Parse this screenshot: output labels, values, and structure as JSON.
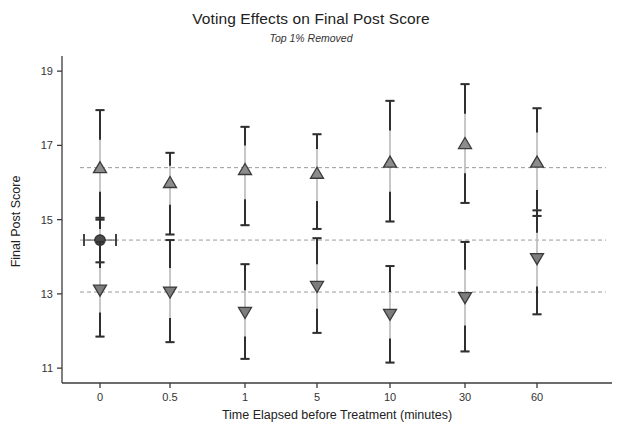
{
  "chart_data": {
    "type": "scatter",
    "title": "Voting Effects on Final Post Score",
    "subtitle": "Top 1% Removed",
    "xlabel": "Time Elapsed before Treatment (minutes)",
    "ylabel": "Final Post Score",
    "categories": [
      "0",
      "0.5",
      "1",
      "5",
      "10",
      "30",
      "60"
    ],
    "xtick_labels": [
      "0",
      "0.5",
      "1",
      "5",
      "10",
      "30",
      "60"
    ],
    "ytick_labels": [
      "19",
      "17",
      "15",
      "13",
      "11"
    ],
    "ytick_values": [
      19,
      17,
      15,
      13,
      11
    ],
    "ylim": [
      10.6,
      19.3
    ],
    "grid": false,
    "legend": "none",
    "reference_lines": [
      {
        "name": "upvote-baseline",
        "value": 16.4
      },
      {
        "name": "control-baseline",
        "value": 14.45
      },
      {
        "name": "downvote-baseline",
        "value": 13.05
      }
    ],
    "series": [
      {
        "name": "Upvoted",
        "marker": "triangle-up",
        "color": "#8c8c8c",
        "edge_color": "#3a3a3a",
        "x": [
          "0",
          "0.5",
          "1",
          "5",
          "10",
          "30",
          "60"
        ],
        "values": [
          16.4,
          16.0,
          16.35,
          16.25,
          16.55,
          17.05,
          16.55
        ],
        "ci_low": [
          15.0,
          14.6,
          14.85,
          14.75,
          14.95,
          15.45,
          15.1
        ],
        "ci_high": [
          17.95,
          16.8,
          17.5,
          17.3,
          18.2,
          18.65,
          18.0
        ],
        "inner_low": [
          15.75,
          15.4,
          15.55,
          15.5,
          15.75,
          16.25,
          15.8
        ],
        "inner_high": [
          17.15,
          16.45,
          17.0,
          16.9,
          17.4,
          17.85,
          17.35
        ]
      },
      {
        "name": "Control",
        "marker": "circle",
        "color": "#4a4a4a",
        "edge_color": "#2b2b2b",
        "x": [
          "0"
        ],
        "values": [
          14.45
        ],
        "ci_low": [
          13.85
        ],
        "ci_high": [
          15.05
        ],
        "inner_low": [
          14.15
        ],
        "inner_high": [
          14.75
        ],
        "x_err_low": -0.28,
        "x_err_high": 0.28
      },
      {
        "name": "Downvoted",
        "marker": "triangle-down",
        "color": "#7d7d7d",
        "edge_color": "#3a3a3a",
        "x": [
          "0",
          "0.5",
          "1",
          "5",
          "10",
          "30",
          "60"
        ],
        "values": [
          13.1,
          13.05,
          12.5,
          13.2,
          12.45,
          12.9,
          13.95
        ],
        "ci_low": [
          11.85,
          11.7,
          11.25,
          11.95,
          11.15,
          11.45,
          12.45
        ],
        "ci_high": [
          14.4,
          14.45,
          13.8,
          14.5,
          13.75,
          14.4,
          15.25
        ],
        "inner_low": [
          12.5,
          12.35,
          11.85,
          12.6,
          11.8,
          12.15,
          13.2
        ],
        "inner_high": [
          13.7,
          13.7,
          13.1,
          13.8,
          13.05,
          13.65,
          14.65
        ]
      }
    ]
  },
  "plot_geometry": {
    "left": 62,
    "right": 612,
    "top": 60,
    "bottom": 383,
    "x_positions": [
      100,
      170,
      245,
      317,
      390,
      465,
      537
    ],
    "group_offset": 0
  }
}
